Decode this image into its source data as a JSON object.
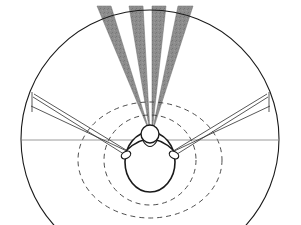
{
  "figure": {
    "title": "Head-centred field-of-view diagram",
    "canvas": {
      "width": 301,
      "height": 225,
      "background": "#ffffff"
    },
    "colors": {
      "outline": "#1a1a1a",
      "cone_fill": "#8a8a8a",
      "cone_edge": "#6f6f6f",
      "dashed_stroke": "#3a3a3a",
      "sight_line": "#3a3a3a",
      "horizon_line": "#8f8f8f",
      "background": "#ffffff"
    },
    "head": {
      "label": "head-top-view",
      "center_x": 150,
      "center_y": 162,
      "radius_x": 25,
      "radius_y": 30,
      "nose_x": 150,
      "nose_y": 134,
      "nose_radius": 9,
      "ear_left_x": 126,
      "ear_right_x": 174,
      "ear_y": 155
    },
    "outer_circle": {
      "label": "outer-boundary-circle",
      "center_x": 150,
      "center_y": 139,
      "radius": 129,
      "stroke_width": 1.1
    },
    "dashed_circles": [
      {
        "label": "dashed-circle-inner",
        "center_x": 150,
        "center_y": 160,
        "radius_x": 46,
        "radius_y": 45
      },
      {
        "label": "dashed-circle-outer",
        "center_x": 150,
        "center_y": 160,
        "radius_x": 72,
        "radius_y": 58
      }
    ],
    "horizon_line": {
      "label": "interaural-horizon-line",
      "x1": 22,
      "y1": 140,
      "x2": 280,
      "y2": 140
    },
    "cones": [
      {
        "name": "cone-1",
        "apex_x": 150,
        "apex_y": 133,
        "top_left_x": 97,
        "top_right_x": 111,
        "top_y": 6
      },
      {
        "name": "cone-2",
        "apex_x": 150,
        "apex_y": 133,
        "top_left_x": 129,
        "top_right_x": 143,
        "top_y": 6
      },
      {
        "name": "cone-3",
        "apex_x": 152,
        "apex_y": 133,
        "top_left_x": 152,
        "top_right_x": 166,
        "top_y": 6
      },
      {
        "name": "cone-4",
        "apex_x": 152,
        "apex_y": 133,
        "top_left_x": 178,
        "top_right_x": 193,
        "top_y": 6
      }
    ],
    "sight_lines": [
      {
        "name": "sight-line-left-upper",
        "x1": 131,
        "y1": 153,
        "x2": 34,
        "y2": 94
      },
      {
        "name": "sight-line-left-lower",
        "x1": 131,
        "y1": 153,
        "x2": 31,
        "y2": 106
      },
      {
        "name": "sight-line-left-ear",
        "x1": 127,
        "y1": 156,
        "x2": 33,
        "y2": 97
      },
      {
        "name": "sight-line-right-upper",
        "x1": 170,
        "y1": 153,
        "x2": 267,
        "y2": 94
      },
      {
        "name": "sight-line-right-lower",
        "x1": 170,
        "y1": 153,
        "x2": 270,
        "y2": 106
      },
      {
        "name": "sight-line-right-ear",
        "x1": 174,
        "y1": 156,
        "x2": 268,
        "y2": 97
      }
    ],
    "chord_marks": [
      {
        "name": "chord-left",
        "x1": 32,
        "y1": 92,
        "x2": 32,
        "y2": 112
      },
      {
        "name": "chord-right",
        "x1": 269,
        "y1": 92,
        "x2": 269,
        "y2": 112
      }
    ]
  }
}
